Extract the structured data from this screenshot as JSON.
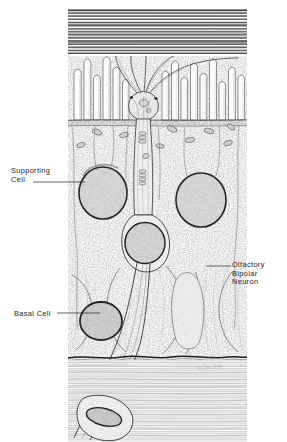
{
  "figure": {
    "width": 287,
    "height": 442,
    "medium": "pen-and-ink stipple illustration",
    "background_color": "#ffffff",
    "ink_color": "#2b2b2b"
  },
  "labels": {
    "supporting_cell": "Supporting\nCell",
    "basal_cell": "Basal Cell",
    "bipolar_neuron": "Olfactory\nBipolar\nNeuron",
    "signature": "sclwink"
  },
  "structures": {
    "mucus_layer": "mucus-layer",
    "cilia": "olfactory-cilia",
    "microvilli": "supporting-cell-microvilli",
    "dendritic_knob": "dendritic-knob",
    "dendrite": "dendrite",
    "soma": "neuron-soma",
    "axon": "axon",
    "basement_membrane": "basement-membrane",
    "lamina_propria": "lamina-propria",
    "schwann_cell": "schwann-cell",
    "mitochondria": "mitochondria"
  },
  "colors": {
    "ink": "#2b2b2b",
    "mid_ink": "#5a5a5a",
    "light_ink": "#9a9a9a",
    "nucleus_fill": "#dcdcdc",
    "cytoplasm": "#f4f4f4"
  }
}
